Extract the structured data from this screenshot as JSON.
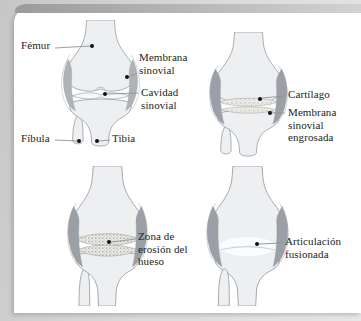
{
  "diagram": {
    "labels": {
      "femur": "Fémur",
      "membrana_sinovial": "Membrana\nsinovial",
      "cavidad_sinovial": "Cavidad\nsinovial",
      "fibula": "Fíbula",
      "tibia": "Tibia",
      "cartilago": "Cartílago",
      "membrana_sinovial_engrosada": "Membrana\nsinovial\nengrosada",
      "zona_erosion_hueso": "Zona de\nerosión del\nhueso",
      "articulacion_fusionada": "Articulación\nfusionada"
    },
    "colors": {
      "page_bg": "#d6d6d6",
      "card_bg": "#ffffff",
      "top_bar_left": "#9b9b9b",
      "top_bar_right": "#d2d2d2",
      "bone_fill": "#edeff1",
      "bone_stroke": "#9aa0a6",
      "synovium_fill": "#aeb3b7",
      "synovium_dark": "#9aa0a5",
      "cartilage_fill": "#f0ede5",
      "label_color": "#1d1d1b",
      "leader_color": "#8f9396",
      "dot_color": "#111111"
    }
  }
}
